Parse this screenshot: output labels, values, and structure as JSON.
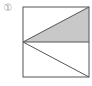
{
  "figure": {
    "label": "①",
    "colors": {
      "stroke": "#555555",
      "shade": "#c8c8c8",
      "label": "#9a9a9a"
    }
  }
}
